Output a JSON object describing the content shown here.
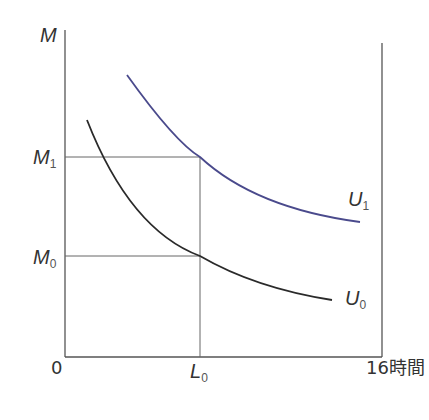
{
  "diagram": {
    "y_axis_label": "M",
    "origin_label": "0",
    "x_axis_end_label": "16時間",
    "y_ticks": [
      {
        "main": "M",
        "sub": "1"
      },
      {
        "main": "M",
        "sub": "0"
      }
    ],
    "x_ticks": [
      {
        "main": "L",
        "sub": "0"
      }
    ],
    "curves": [
      {
        "main": "U",
        "sub": "1",
        "color": "#4a4a8c"
      },
      {
        "main": "U",
        "sub": "0",
        "color": "#2a2a2a"
      }
    ],
    "colors": {
      "axis": "#555555",
      "guide": "#666666",
      "u1": "#4a4a8c",
      "u0": "#2a2a2a"
    }
  }
}
